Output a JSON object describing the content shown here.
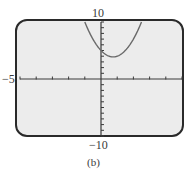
{
  "chart_data": {
    "type": "line",
    "title": "",
    "caption": "(b)",
    "xlabel": "",
    "ylabel": "",
    "xlim": [
      -5,
      5
    ],
    "ylim": [
      -10,
      10
    ],
    "x_tick_step": 1,
    "y_tick_step": 1,
    "grid": false,
    "tick_labels": {
      "y_top": "10",
      "y_bottom": "-10",
      "x_left": "-5"
    },
    "series": [
      {
        "name": "parabola",
        "equation_estimate": "y = 2x^2 - 3x + 5",
        "x": [
          -1.0,
          -0.5,
          0.0,
          0.5,
          0.75,
          1.0,
          1.5,
          2.0,
          2.5
        ],
        "y": [
          10.0,
          7.0,
          5.0,
          4.0,
          3.875,
          4.0,
          5.0,
          7.0,
          10.0
        ],
        "color": "#6a6a6a"
      }
    ]
  },
  "labels": {
    "y_top": "10",
    "y_bottom": "−10",
    "x_left": "−5",
    "caption": "(b)"
  },
  "colors": {
    "screen_bg": "#ececec",
    "frame": "#2a2a2a",
    "axis": "#3a3a3a",
    "curve": "#6a6a6a"
  }
}
